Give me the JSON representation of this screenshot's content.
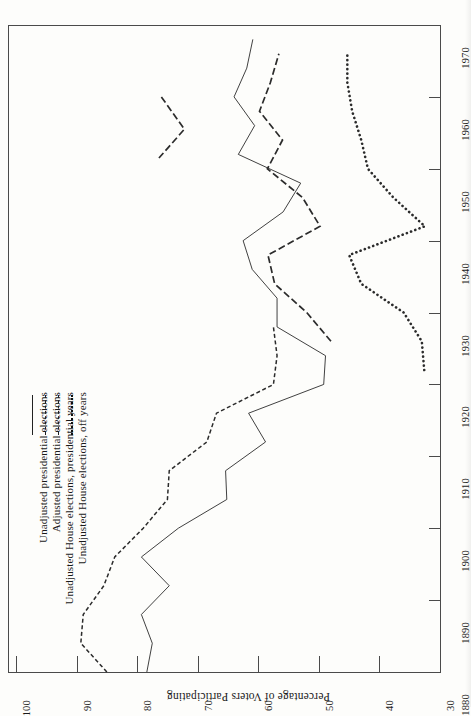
{
  "chart_data": {
    "type": "line",
    "title": "",
    "orientation": "rotated-90ccw",
    "xlabel": "",
    "ylabel": "Percentage of Voters Participating",
    "xlim": [
      1880,
      1970
    ],
    "ylim": [
      30,
      100
    ],
    "x_ticks": [
      1880,
      1890,
      1900,
      1910,
      1920,
      1930,
      1940,
      1950,
      1960,
      1970
    ],
    "y_ticks": [
      30,
      40,
      50,
      60,
      70,
      80,
      90,
      100
    ],
    "grid": false,
    "legend_position": "upper-left",
    "series": [
      {
        "name": "Unadjusted presidential elections",
        "style": "solid",
        "x": [
          1880,
          1884,
          1888,
          1892,
          1896,
          1900,
          1904,
          1908,
          1912,
          1916,
          1920,
          1924,
          1928,
          1932,
          1936,
          1940,
          1944,
          1948,
          1952,
          1956,
          1960,
          1964,
          1968
        ],
        "values": [
          78.4,
          77.5,
          79.3,
          74.7,
          79.3,
          73.2,
          65.2,
          65.4,
          58.8,
          61.6,
          49.2,
          48.9,
          56.9,
          56.9,
          61.0,
          62.5,
          55.9,
          53.0,
          63.3,
          60.6,
          64.0,
          61.9,
          60.9
        ]
      },
      {
        "name": "Adjusted presidential elections",
        "style": "dashed-small",
        "x": [
          1880,
          1884,
          1888,
          1892,
          1896,
          1900,
          1904,
          1908,
          1912,
          1916,
          1920,
          1924,
          1928
        ],
        "values": [
          85.0,
          89.3,
          88.9,
          85.5,
          83.7,
          79.0,
          75.0,
          74.7,
          68.5,
          66.9,
          57.5,
          56.9,
          57.5
        ]
      },
      {
        "name": "Unadjusted House elections, presidential years",
        "style": "dashed-long",
        "x": [
          1926,
          1930,
          1934,
          1938,
          1942,
          1946,
          1950,
          1954,
          1958,
          1962,
          1966
        ],
        "values": [
          48.0,
          52.0,
          57.3,
          58.4,
          49.8,
          52.7,
          58.5,
          56.0,
          59.8,
          58.0,
          56.6
        ]
      },
      {
        "name": "Unadjusted House elections, off years",
        "style": "dotted",
        "x": [
          1922,
          1926,
          1930,
          1934,
          1938,
          1942,
          1946,
          1950,
          1954,
          1958,
          1962,
          1966
        ],
        "values": [
          32.6,
          33.0,
          36.0,
          43.0,
          45.0,
          32.5,
          37.7,
          41.9,
          43.0,
          44.5,
          45.3,
          45.3
        ]
      }
    ]
  },
  "axes": {
    "y_axis_title": "Percentage of Voters Participating",
    "y_tick_labels": [
      "100",
      "90",
      "80",
      "70",
      "60",
      "50",
      "40",
      "30"
    ],
    "x_tick_labels": [
      "1880",
      "1890",
      "1900",
      "1910",
      "1920",
      "1930",
      "1940",
      "1950",
      "1960",
      "1970"
    ]
  },
  "legend": {
    "items": [
      {
        "label": "Unadjusted presidential elections",
        "style": "solid"
      },
      {
        "label": "Adjusted presidential elections",
        "style": "dashed-small"
      },
      {
        "label": "Unadjusted  House  elections,  presidential years",
        "style": "dashed-long"
      },
      {
        "label": "Unadjusted  House  elections,  off  years",
        "style": "dotted"
      }
    ]
  }
}
